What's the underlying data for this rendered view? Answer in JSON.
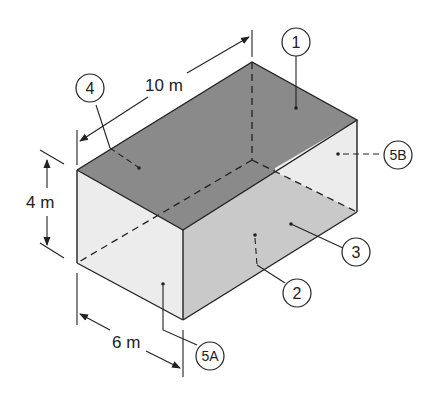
{
  "figure": {
    "dimensions": {
      "length": "10 m",
      "height": "4 m",
      "width": "6 m"
    },
    "surface_labels": [
      {
        "id": "1",
        "text": "1"
      },
      {
        "id": "2",
        "text": "2"
      },
      {
        "id": "3",
        "text": "3"
      },
      {
        "id": "4",
        "text": "4"
      },
      {
        "id": "5A",
        "text": "5A"
      },
      {
        "id": "5B",
        "text": "5B"
      }
    ],
    "colors": {
      "top_surface": "#8a8a8a",
      "front_long_face": "#c9c9c9",
      "end_face": "#ececec",
      "line": "#222222"
    }
  }
}
